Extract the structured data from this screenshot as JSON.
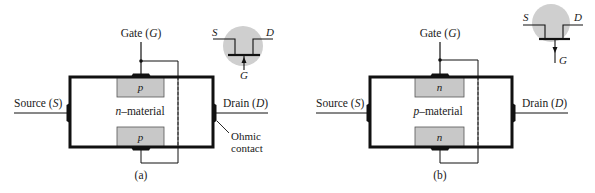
{
  "colors": {
    "line": "#111111",
    "block_fill": "#c8c8c8",
    "block_stroke": "#555555",
    "circle_fill": "#cfcfcf"
  },
  "panel_a": {
    "gate_label": "Gate (",
    "gate_symbol": "G",
    "gate_close": ")",
    "source_label": "Source (",
    "source_symbol": "S",
    "source_close": ")",
    "drain_label": "Drain (",
    "drain_symbol": "D",
    "drain_close": ")",
    "material_prefix": "n",
    "material_suffix": "–material",
    "block_top": "p",
    "block_bottom": "p",
    "ohmic_line1": "Ohmic",
    "ohmic_line2": "contact",
    "caption": "(a)",
    "symbol": {
      "s": "S",
      "d": "D",
      "g": "G",
      "arrow": "up"
    }
  },
  "panel_b": {
    "gate_label": "Gate (",
    "gate_symbol": "G",
    "gate_close": ")",
    "source_label": "Source (",
    "source_symbol": "S",
    "source_close": ")",
    "drain_label": "Drain (",
    "drain_symbol": "D",
    "drain_close": ")",
    "material_prefix": "p",
    "material_suffix": "–material",
    "block_top": "n",
    "block_bottom": "n",
    "caption": "(b)",
    "symbol": {
      "s": "S",
      "d": "D",
      "g": "G",
      "arrow": "down"
    }
  }
}
